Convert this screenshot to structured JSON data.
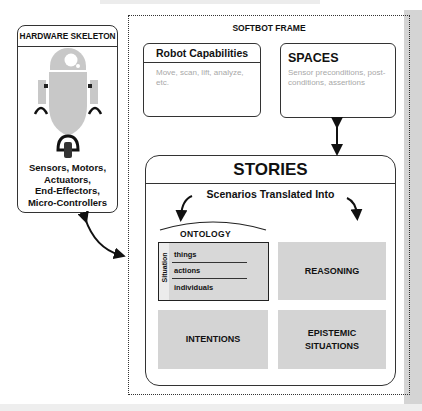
{
  "hardware_skeleton": {
    "title": "HARDWARE SKELETON",
    "icon": "robot-icon",
    "description_lines": [
      "Sensors, Motors,",
      "Actuators,",
      "End-Effectors,",
      "Micro-Controllers"
    ]
  },
  "softbot_frame": {
    "title": "SOFTBOT FRAME",
    "robot_capabilities": {
      "title": "Robot Capabilities",
      "description": "Move, scan, lift, analyze, etc."
    },
    "spaces": {
      "title": "SPACES",
      "description": "Sensor preconditions, post-conditions, assertions"
    },
    "stories": {
      "title": "STORIES",
      "subtitle": "Scenarios Translated Into",
      "ontology": {
        "title": "ONTOLOGY",
        "side_label": "Situation",
        "items": [
          "things",
          "actions",
          "individuals"
        ]
      },
      "cards": {
        "reasoning": "REASONING",
        "intentions": "INTENTIONS",
        "epistemic_line1": "EPISTEMIC",
        "epistemic_line2": "SITUATIONS"
      }
    }
  },
  "colors": {
    "stroke": "#333333",
    "card_fill": "#d4d4d4",
    "robot_fill": "#c8c8c8",
    "muted_text": "#a8a8a8"
  }
}
